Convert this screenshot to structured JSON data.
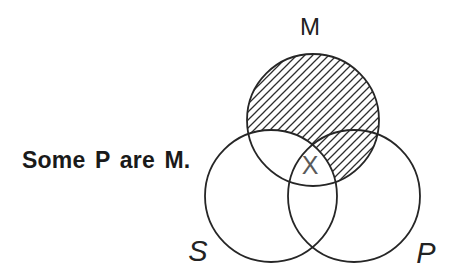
{
  "statement": {
    "text": "Some P are M."
  },
  "diagram": {
    "labels": {
      "m": "M",
      "s": "S",
      "p": "P"
    },
    "x_mark": "X",
    "colors": {
      "stroke": "#262626",
      "hatch": "#2e2e2e",
      "x_mark": "#5a5a5a",
      "text": "#1a1a1a",
      "background": "#ffffff"
    }
  }
}
